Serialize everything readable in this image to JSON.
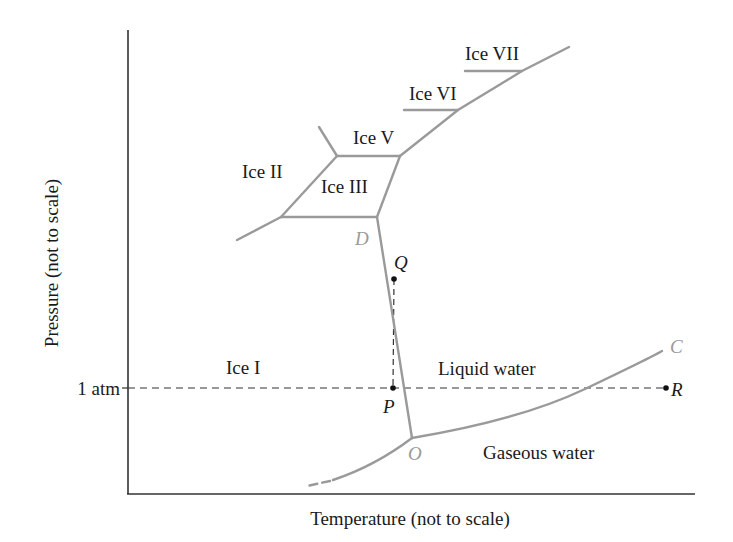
{
  "diagram": {
    "axes": {
      "x_label": "Temperature (not to scale)",
      "y_label": "Pressure (not to scale)",
      "y_tick": "1 atm"
    },
    "regions": {
      "ice_1": "Ice I",
      "ice_2": "Ice II",
      "ice_3": "Ice III",
      "ice_5": "Ice V",
      "ice_6": "Ice VI",
      "ice_7": "Ice VII",
      "liquid": "Liquid water",
      "gas": "Gaseous water"
    },
    "points": {
      "D": "D",
      "Q": "Q",
      "P": "P",
      "O": "O",
      "C": "C",
      "R": "R"
    },
    "colors": {
      "phase_line": "#9a9a9a",
      "axis": "#333333",
      "dashed": "#333333",
      "point": "#111111"
    }
  }
}
